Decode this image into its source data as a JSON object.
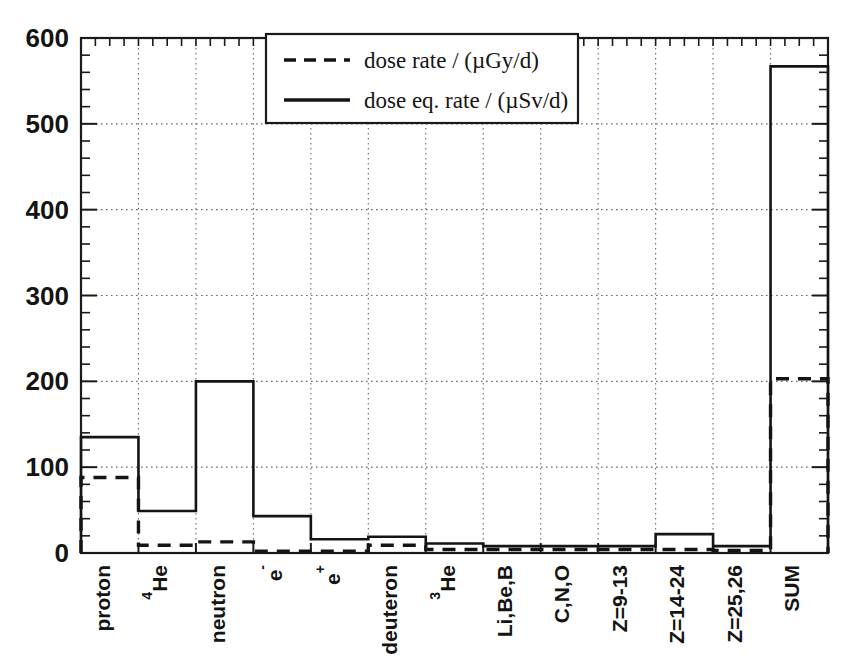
{
  "chart_data": {
    "type": "bar",
    "title": "",
    "subtitle": "",
    "xlabel": "",
    "ylabel": "",
    "ylim": [
      0,
      600
    ],
    "y_ticks": [
      0,
      100,
      200,
      300,
      400,
      500,
      600
    ],
    "y_tick_labels": [
      "0",
      "100",
      "200",
      "300",
      "400",
      "500",
      "600"
    ],
    "y_minor_tick_step": 20,
    "grid": "horizontal-and-vertical dotted",
    "legend_position": "top-center-right",
    "style": "step histogram outline",
    "categories": [
      "proton",
      "4He",
      "neutron",
      "e-",
      "e+",
      "deuteron",
      "3He",
      "Li,Be,B",
      "C,N,O",
      "Z=9-13",
      "Z=14-24",
      "Z=25,26",
      "SUM"
    ],
    "category_labels": [
      {
        "base": "proton",
        "sup_pre": "",
        "sup_post": ""
      },
      {
        "base": "He",
        "sup_pre": "4",
        "sup_post": ""
      },
      {
        "base": "neutron",
        "sup_pre": "",
        "sup_post": ""
      },
      {
        "base": "e",
        "sup_pre": "",
        "sup_post": "-"
      },
      {
        "base": "e",
        "sup_pre": "",
        "sup_post": "+"
      },
      {
        "base": "deuteron",
        "sup_pre": "",
        "sup_post": ""
      },
      {
        "base": "He",
        "sup_pre": "3",
        "sup_post": ""
      },
      {
        "base": "Li,Be,B",
        "sup_pre": "",
        "sup_post": ""
      },
      {
        "base": "C,N,O",
        "sup_pre": "",
        "sup_post": ""
      },
      {
        "base": "Z=9-13",
        "sup_pre": "",
        "sup_post": ""
      },
      {
        "base": "Z=14-24",
        "sup_pre": "",
        "sup_post": ""
      },
      {
        "base": "Z=25,26",
        "sup_pre": "",
        "sup_post": ""
      },
      {
        "base": "SUM",
        "sup_pre": "",
        "sup_post": ""
      }
    ],
    "series": [
      {
        "name": "dose rate / (µGy/d)",
        "line_style": "dashed",
        "color": "#141414",
        "values": [
          88,
          9,
          13,
          2,
          2,
          9,
          4,
          4,
          4,
          4,
          4,
          3,
          203
        ]
      },
      {
        "name": "dose eq. rate / (µSv/d)",
        "line_style": "solid",
        "color": "#141414",
        "values": [
          135,
          49,
          200,
          43,
          16,
          19,
          11,
          8,
          8,
          8,
          22,
          8,
          567
        ]
      }
    ]
  },
  "legend": {
    "entries": [
      {
        "label": "dose rate / (µGy/d)",
        "style": "dashed"
      },
      {
        "label": "dose eq. rate / (µSv/d)",
        "style": "solid"
      }
    ]
  },
  "colors": {
    "axis": "#1a1a1a",
    "grid": "#6a6a6a",
    "series": "#141414",
    "background": "#ffffff"
  }
}
